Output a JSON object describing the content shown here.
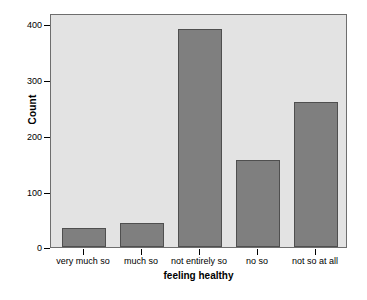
{
  "chart_data": {
    "type": "bar",
    "title": "",
    "subtitle": "",
    "xlabel": "feeling healthy",
    "ylabel": "Count",
    "categories": [
      "very much so",
      "much so",
      "not entirely so",
      "no so",
      "not so at all"
    ],
    "values": [
      34,
      43,
      396,
      158,
      264
    ],
    "ylim": [
      0,
      418
    ],
    "yticks": [
      0,
      100,
      200,
      300,
      400
    ],
    "ytick_labels": [
      "0",
      "100",
      "200",
      "300",
      "400"
    ],
    "grid": false,
    "legend": "none",
    "colors": {
      "bar_fill": "#7f7f7f",
      "bar_border": "#4f4f4f",
      "panel_background": "#e3e3e3",
      "panel_border": "#6e6e6e",
      "axis_text": "#000000",
      "figure_background": "#ffffff"
    }
  },
  "axes": {
    "y_title": "Count",
    "x_title": "feeling healthy"
  }
}
